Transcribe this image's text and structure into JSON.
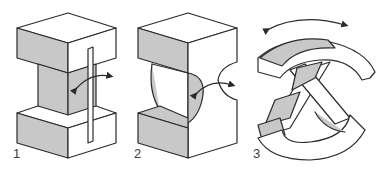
{
  "diagram": {
    "type": "flexure-hinge-illustration",
    "colors": {
      "outline": "#2b2b2b",
      "shaded_face": "#c8c8c8",
      "light_face": "#ffffff",
      "background": "#ffffff"
    },
    "figures": [
      {
        "label": "1",
        "description": "Block flexure with thin vertical leaf spring and rotation arrow"
      },
      {
        "label": "2",
        "description": "Notch (circular cut-out) flexure hinge with rotation arrow"
      },
      {
        "label": "3",
        "description": "Cross-spring (X) curved flexure pivot with double-headed arc arrow"
      }
    ]
  }
}
